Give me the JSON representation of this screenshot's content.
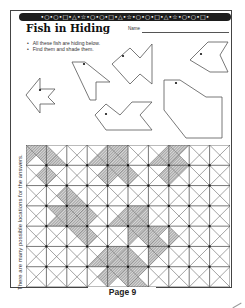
{
  "worksheet": {
    "banner_pattern": "•○•○•□•△•☆•○•○•□•△•☆•○•○•□•△•☆•○•○•□•",
    "title": "Fish in Hiding",
    "name_label": "Name",
    "instructions": [
      "All these fish are hiding below.",
      "Find them and shade them."
    ],
    "side_note": "There are many possible locations for the answers.",
    "page_label": "Page 9"
  },
  "fish_shapes": [
    {
      "id": "fish-1",
      "points": "26,95 40,78 40,89 55,89 48,97 55,104 40,104 40,113",
      "eye": [
        40,
        90
      ]
    },
    {
      "id": "fish-2",
      "points": "72,62 85,62 110,82 96,82 96,100 90,100",
      "eye": [
        84,
        64
      ]
    },
    {
      "id": "fish-3",
      "points": "112,64 130,48 140,58 152,44 152,84 140,74 130,84",
      "eye": [
        123,
        56
      ]
    },
    {
      "id": "fish-4",
      "points": "95,115 106,104 120,115 132,102 152,102 140,115 152,130 106,130",
      "eye": [
        106,
        114
      ]
    },
    {
      "id": "fish-5",
      "points": "164,80 180,80 206,97 222,97 222,138 186,138 164,110",
      "eye": [
        176,
        83
      ]
    },
    {
      "id": "fish-6",
      "points": "190,60 208,42 228,42 220,55 228,72 210,72",
      "eye": [
        201,
        54
      ]
    }
  ],
  "grid": {
    "cols": 10,
    "rows": 7,
    "cell_px": 20.4,
    "shaded_triangles": [
      {
        "r": 0,
        "c": 0,
        "t": "n"
      },
      {
        "r": 0,
        "c": 0,
        "t": "w"
      },
      {
        "r": 0,
        "c": 0,
        "t": "e"
      },
      {
        "r": 0,
        "c": 1,
        "t": "w"
      },
      {
        "r": 0,
        "c": 1,
        "t": "s"
      },
      {
        "r": 1,
        "c": 0,
        "t": "e"
      },
      {
        "r": 1,
        "c": 1,
        "t": "w"
      },
      {
        "r": 0,
        "c": 3,
        "t": "s"
      },
      {
        "r": 0,
        "c": 3,
        "t": "e"
      },
      {
        "r": 0,
        "c": 4,
        "t": "n"
      },
      {
        "r": 0,
        "c": 4,
        "t": "w"
      },
      {
        "r": 0,
        "c": 4,
        "t": "s"
      },
      {
        "r": 0,
        "c": 4,
        "t": "e"
      },
      {
        "r": 1,
        "c": 3,
        "t": "e"
      },
      {
        "r": 1,
        "c": 4,
        "t": "n"
      },
      {
        "r": 1,
        "c": 4,
        "t": "w"
      },
      {
        "r": 1,
        "c": 4,
        "t": "e"
      },
      {
        "r": 1,
        "c": 5,
        "t": "w"
      },
      {
        "r": 0,
        "c": 6,
        "t": "s"
      },
      {
        "r": 0,
        "c": 6,
        "t": "e"
      },
      {
        "r": 0,
        "c": 7,
        "t": "n"
      },
      {
        "r": 0,
        "c": 7,
        "t": "w"
      },
      {
        "r": 0,
        "c": 7,
        "t": "s"
      },
      {
        "r": 1,
        "c": 6,
        "t": "e"
      },
      {
        "r": 1,
        "c": 7,
        "t": "n"
      },
      {
        "r": 1,
        "c": 7,
        "t": "w"
      },
      {
        "r": 2,
        "c": 1,
        "t": "e"
      },
      {
        "r": 2,
        "c": 2,
        "t": "w"
      },
      {
        "r": 2,
        "c": 2,
        "t": "s"
      },
      {
        "r": 3,
        "c": 1,
        "t": "n"
      },
      {
        "r": 3,
        "c": 1,
        "t": "e"
      },
      {
        "r": 3,
        "c": 1,
        "t": "s"
      },
      {
        "r": 3,
        "c": 2,
        "t": "n"
      },
      {
        "r": 3,
        "c": 2,
        "t": "w"
      },
      {
        "r": 3,
        "c": 2,
        "t": "s"
      },
      {
        "r": 3,
        "c": 2,
        "t": "e"
      },
      {
        "r": 3,
        "c": 3,
        "t": "w"
      },
      {
        "r": 3,
        "c": 4,
        "t": "e"
      },
      {
        "r": 3,
        "c": 4,
        "t": "s"
      },
      {
        "r": 3,
        "c": 5,
        "t": "n"
      },
      {
        "r": 3,
        "c": 5,
        "t": "w"
      },
      {
        "r": 3,
        "c": 5,
        "t": "s"
      },
      {
        "r": 3,
        "c": 5,
        "t": "e"
      },
      {
        "r": 4,
        "c": 2,
        "t": "n"
      },
      {
        "r": 4,
        "c": 2,
        "t": "e"
      },
      {
        "r": 4,
        "c": 3,
        "t": "w"
      },
      {
        "r": 4,
        "c": 5,
        "t": "n"
      },
      {
        "r": 4,
        "c": 5,
        "t": "w"
      },
      {
        "r": 4,
        "c": 5,
        "t": "e"
      },
      {
        "r": 4,
        "c": 6,
        "t": "n"
      },
      {
        "r": 4,
        "c": 6,
        "t": "w"
      },
      {
        "r": 4,
        "c": 6,
        "t": "s"
      },
      {
        "r": 4,
        "c": 7,
        "t": "w"
      },
      {
        "r": 5,
        "c": 3,
        "t": "e"
      },
      {
        "r": 5,
        "c": 3,
        "t": "s"
      },
      {
        "r": 5,
        "c": 4,
        "t": "n"
      },
      {
        "r": 5,
        "c": 4,
        "t": "w"
      },
      {
        "r": 5,
        "c": 4,
        "t": "s"
      },
      {
        "r": 5,
        "c": 4,
        "t": "e"
      },
      {
        "r": 5,
        "c": 5,
        "t": "w"
      },
      {
        "r": 5,
        "c": 5,
        "t": "s"
      },
      {
        "r": 5,
        "c": 6,
        "t": "n"
      },
      {
        "r": 5,
        "c": 6,
        "t": "w"
      },
      {
        "r": 6,
        "c": 3,
        "t": "e"
      },
      {
        "r": 6,
        "c": 4,
        "t": "n"
      },
      {
        "r": 6,
        "c": 4,
        "t": "w"
      },
      {
        "r": 6,
        "c": 4,
        "t": "e"
      },
      {
        "r": 6,
        "c": 5,
        "t": "n"
      },
      {
        "r": 6,
        "c": 5,
        "t": "w"
      },
      {
        "r": 6,
        "c": 5,
        "t": "s"
      }
    ]
  }
}
